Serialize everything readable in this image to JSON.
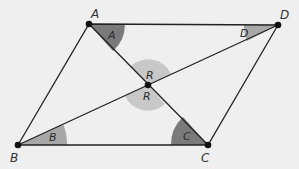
{
  "diagram": {
    "type": "parallelogram with diagonals",
    "vertices": [
      {
        "id": "A",
        "label": "A",
        "x": 89,
        "y": 24
      },
      {
        "id": "D",
        "label": "D",
        "x": 278,
        "y": 25
      },
      {
        "id": "B",
        "label": "B",
        "x": 18,
        "y": 145
      },
      {
        "id": "C",
        "label": "C",
        "x": 208,
        "y": 145
      }
    ],
    "intersection": {
      "label_top": "R",
      "label_bottom": "R",
      "x": 148,
      "y": 85
    },
    "angles": [
      {
        "vertex": "A",
        "label": "A",
        "color": "#7a7a7a"
      },
      {
        "vertex": "D",
        "label": "D",
        "color": "#a8a8a8"
      },
      {
        "vertex": "B",
        "label": "B",
        "color": "#a8a8a8"
      },
      {
        "vertex": "C",
        "label": "C",
        "color": "#7a7a7a"
      },
      {
        "vertex": "R",
        "label": "R",
        "color": "#c8c8c8"
      }
    ],
    "colors": {
      "background": "#efefef",
      "line": "#222222",
      "dark_angle": "#7a7a7a",
      "mid_angle": "#a8a8a8",
      "light_angle": "#c8c8c8"
    }
  }
}
